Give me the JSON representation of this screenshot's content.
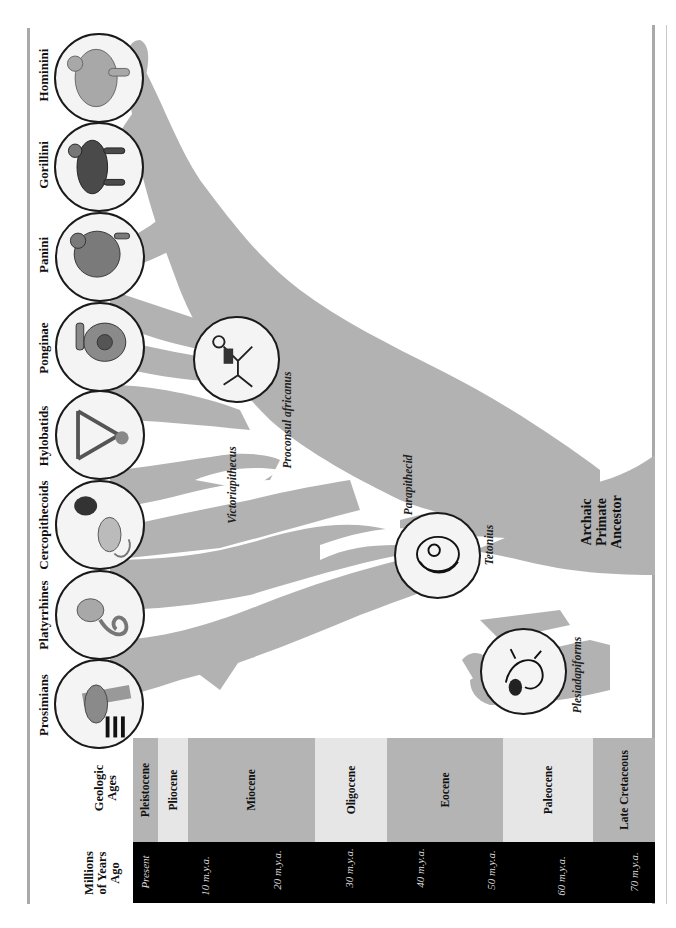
{
  "headers": {
    "millions_of_years_ago": [
      "Millions",
      "of Years",
      "Ago"
    ],
    "geologic_ages": [
      "Geologic",
      "Ages"
    ]
  },
  "timeline": {
    "mya_ticks": [
      {
        "label": "Present",
        "x": 145
      },
      {
        "label": "10 m.y.a.",
        "x": 205
      },
      {
        "label": "20 m.y.a.",
        "x": 277
      },
      {
        "label": "30 m.y.a.",
        "x": 349
      },
      {
        "label": "40 m.y.a.",
        "x": 420
      },
      {
        "label": "50 m.y.a.",
        "x": 491
      },
      {
        "label": "60 m.y.a.",
        "x": 561
      },
      {
        "label": "70 m.y.a.",
        "x": 634
      }
    ],
    "epochs": [
      {
        "label": "Pleistocene",
        "x0": 133,
        "x1": 158,
        "color": "#b4b4b4"
      },
      {
        "label": "Pliocene",
        "x0": 158,
        "x1": 188,
        "color": "#e6e6e6"
      },
      {
        "label": "Miocene",
        "x0": 188,
        "x1": 315,
        "color": "#b4b4b4"
      },
      {
        "label": "Oligocene",
        "x0": 315,
        "x1": 387,
        "color": "#e6e6e6"
      },
      {
        "label": "Eocene",
        "x0": 387,
        "x1": 503,
        "color": "#b4b4b4"
      },
      {
        "label": "Paleocene",
        "x0": 503,
        "x1": 593,
        "color": "#e6e6e6"
      },
      {
        "label": "Late Cretaceous",
        "x0": 593,
        "x1": 655,
        "color": "#b4b4b4"
      }
    ]
  },
  "clades": [
    {
      "label": "Hominini",
      "icon": "human-figure-icon"
    },
    {
      "label": "Gorillini",
      "icon": "gorilla-figure-icon"
    },
    {
      "label": "Panini",
      "icon": "chimpanzee-figure-icon"
    },
    {
      "label": "Ponginae",
      "icon": "orangutan-figure-icon"
    },
    {
      "label": "Hylobatids",
      "icon": "gibbon-figure-icon"
    },
    {
      "label": "Cercopithecoids",
      "icon": "old-world-monkey-figure-icon"
    },
    {
      "label": "Platyrrhines",
      "icon": "new-world-monkey-figure-icon"
    },
    {
      "label": "Prosimians",
      "icon": "lemur-figure-icon"
    }
  ],
  "fossils": {
    "victoriapithecus": "Victoriapithecus",
    "proconsul": "Proconsul africanus",
    "parapithecid": "Parapithecid",
    "teilhardina": "Tetonius",
    "plesiadapiforms": "Plesiadapiforms"
  },
  "ancestor": [
    "Archaic",
    "Primate",
    "Ancestor"
  ],
  "colors": {
    "tree": "#b2b2b2",
    "dark_band": "#000000",
    "light_epoch": "#e6e6e6",
    "dark_epoch": "#b4b4b4",
    "frame": "#a9a9a9"
  }
}
